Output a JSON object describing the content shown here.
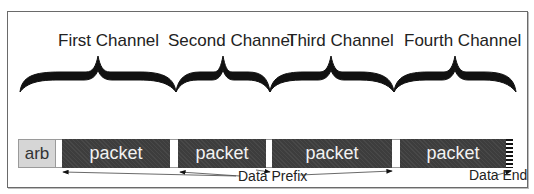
{
  "diagram": {
    "channels": [
      {
        "label": "First Channel"
      },
      {
        "label": "Second Channel"
      },
      {
        "label": "Third Channel"
      },
      {
        "label": "Fourth Channel"
      }
    ],
    "blocks": {
      "arb": "arb",
      "packets": [
        "packet",
        "packet",
        "packet",
        "packet"
      ]
    },
    "annotations": {
      "data_prefix": "Data Prefix",
      "data_end": "Data End"
    },
    "colors": {
      "packet_fill": "#3d3d3d",
      "arb_fill": "#d6d6d6",
      "frame_border": "#6a6a6a"
    }
  }
}
